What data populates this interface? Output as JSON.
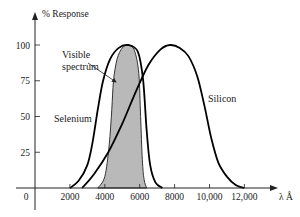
{
  "chart_data": {
    "type": "line",
    "title": "",
    "xlabel": "λ Å",
    "ylabel": "% Response",
    "xlim": [
      0,
      14000
    ],
    "ylim": [
      0,
      110
    ],
    "grid": false,
    "legend": "none (direct labels)",
    "x_ticks": [
      {
        "value": 0,
        "label": "0"
      },
      {
        "value": 2000,
        "label": "2000"
      },
      {
        "value": 4000,
        "label": "4000"
      },
      {
        "value": 6000,
        "label": "6000"
      },
      {
        "value": 8000,
        "label": "8000"
      },
      {
        "value": 10000,
        "label": "10,000"
      },
      {
        "value": 12000,
        "label": "12,000"
      }
    ],
    "y_ticks": [
      {
        "value": 25,
        "label": "25"
      },
      {
        "value": 50,
        "label": "50"
      },
      {
        "value": 75,
        "label": "75"
      },
      {
        "value": 100,
        "label": "100"
      }
    ],
    "series": [
      {
        "name": "Visible spectrum",
        "style": "filled",
        "fill": "#b9b9b9",
        "stroke": "#333333",
        "x": [
          3600,
          4000,
          4250,
          4400,
          4500,
          4700,
          5000,
          5350,
          5700,
          5950,
          6050,
          6150,
          6250,
          6400
        ],
        "y": [
          0,
          8,
          30,
          55,
          75,
          90,
          98,
          100,
          96,
          80,
          50,
          20,
          6,
          0
        ]
      },
      {
        "name": "Selenium",
        "style": "line",
        "stroke": "#000000",
        "x": [
          2000,
          2500,
          3000,
          3300,
          3600,
          3900,
          4300,
          4800,
          5350,
          5900,
          6200,
          6400,
          6600,
          6900,
          7300
        ],
        "y": [
          0,
          5,
          16,
          32,
          55,
          75,
          90,
          98,
          100,
          95,
          75,
          40,
          16,
          4,
          0
        ]
      },
      {
        "name": "Silicon",
        "style": "line",
        "stroke": "#000000",
        "x": [
          2700,
          3400,
          4200,
          5000,
          5800,
          6500,
          7200,
          7750,
          8300,
          8800,
          9300,
          9700,
          10100,
          10500,
          11000,
          11500,
          12000
        ],
        "y": [
          0,
          10,
          25,
          45,
          68,
          86,
          97,
          100,
          98,
          92,
          78,
          58,
          35,
          18,
          8,
          2,
          0
        ]
      }
    ],
    "annotations": [
      {
        "text": "Visible",
        "x_px": 62,
        "y_px": 58
      },
      {
        "text": "spectrum",
        "x_px": 62,
        "y_px": 70
      },
      {
        "text": "Selenium",
        "x_px": 54,
        "y_px": 122
      },
      {
        "text": "Silicon",
        "x_px": 208,
        "y_px": 102
      }
    ],
    "arrow": {
      "from_px": [
        88,
        63
      ],
      "to_px": [
        116,
        82
      ],
      "label": "Visible spectrum pointer"
    }
  }
}
